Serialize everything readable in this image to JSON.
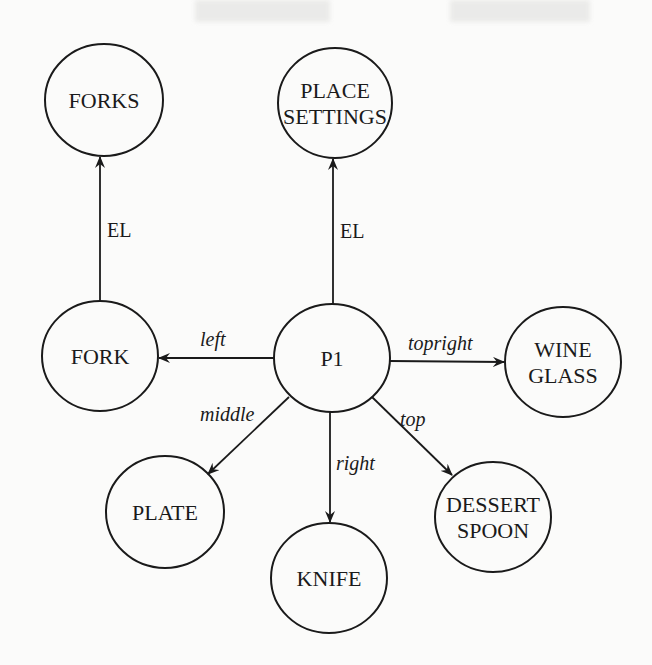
{
  "diagram": {
    "type": "semantic-network",
    "nodes": [
      {
        "id": "forks",
        "lines": [
          "FORKS"
        ],
        "cx": 104,
        "cy": 100,
        "rx": 59,
        "ry": 56
      },
      {
        "id": "place-settings",
        "lines": [
          "PLACE",
          "SETTINGS"
        ],
        "cx": 335,
        "cy": 103,
        "rx": 57,
        "ry": 55
      },
      {
        "id": "fork",
        "lines": [
          "FORK"
        ],
        "cx": 100,
        "cy": 356,
        "rx": 58,
        "ry": 55
      },
      {
        "id": "p1",
        "lines": [
          "P1"
        ],
        "cx": 332,
        "cy": 358,
        "rx": 58,
        "ry": 54
      },
      {
        "id": "wine-glass",
        "lines": [
          "WINE",
          "GLASS"
        ],
        "cx": 563,
        "cy": 362,
        "rx": 58,
        "ry": 55
      },
      {
        "id": "plate",
        "lines": [
          "PLATE"
        ],
        "cx": 165,
        "cy": 512,
        "rx": 59,
        "ry": 56
      },
      {
        "id": "knife",
        "lines": [
          "KNIFE"
        ],
        "cx": 329,
        "cy": 578,
        "rx": 58,
        "ry": 55
      },
      {
        "id": "dessert-spoon",
        "lines": [
          "DESSERT",
          "SPOON"
        ],
        "cx": 493,
        "cy": 517,
        "rx": 58,
        "ry": 55
      }
    ],
    "edges": [
      {
        "id": "fork-el-forks",
        "from": "fork",
        "to": "forks",
        "label": "EL",
        "italic": false,
        "x1": 100,
        "y1": 301,
        "x2": 100,
        "y2": 157,
        "lx": 107,
        "ly": 237
      },
      {
        "id": "p1-el-place-settings",
        "from": "p1",
        "to": "place-settings",
        "label": "EL",
        "italic": false,
        "x1": 333,
        "y1": 304,
        "x2": 333,
        "y2": 159,
        "lx": 340,
        "ly": 238
      },
      {
        "id": "p1-left-fork",
        "from": "p1",
        "to": "fork",
        "label": "left",
        "italic": true,
        "x1": 274,
        "y1": 358,
        "x2": 159,
        "y2": 358,
        "lx": 200,
        "ly": 346
      },
      {
        "id": "p1-topright-wine-glass",
        "from": "p1",
        "to": "wine-glass",
        "label": "topright",
        "italic": true,
        "x1": 390,
        "y1": 361,
        "x2": 504,
        "y2": 362,
        "lx": 408,
        "ly": 350
      },
      {
        "id": "p1-middle-plate",
        "from": "p1",
        "to": "plate",
        "label": "middle",
        "italic": true,
        "x1": 289,
        "y1": 397,
        "x2": 208,
        "y2": 474,
        "lx": 200,
        "ly": 421
      },
      {
        "id": "p1-right-knife",
        "from": "p1",
        "to": "knife",
        "label": "right",
        "italic": true,
        "x1": 330,
        "y1": 412,
        "x2": 330,
        "y2": 522,
        "lx": 336,
        "ly": 470
      },
      {
        "id": "p1-top-dessert-spoon",
        "from": "p1",
        "to": "dessert-spoon",
        "label": "top",
        "italic": true,
        "x1": 372,
        "y1": 397,
        "x2": 452,
        "y2": 475,
        "lx": 400,
        "ly": 426
      }
    ]
  },
  "colors": {
    "background": "#fbfbfa",
    "ink": "#1a1a1a"
  }
}
